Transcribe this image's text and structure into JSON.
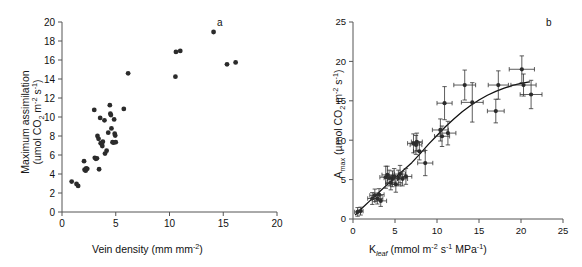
{
  "figure": {
    "width": 582,
    "height": 267,
    "background": "#ffffff",
    "marker_color": "#2b2b2b",
    "axis_color": "#555555",
    "curve_color": "#111111"
  },
  "panels": [
    {
      "letter": "a",
      "name": "panel-a"
    },
    {
      "letter": "b",
      "name": "panel-b"
    }
  ],
  "chart_data": [
    {
      "type": "scatter",
      "panel": "a",
      "title": "",
      "xlabel": "Vein density (mm mm",
      "xlabel_sup": "-2",
      "xlabel_tail": ")",
      "ylabel_line1": "Maximum assimilation",
      "ylabel_line2_pre": "(umol CO",
      "ylabel_line2_sub": "2",
      "ylabel_line2_mid": " m",
      "ylabel_line2_sup1": "-2",
      "ylabel_line2_mid2": " s",
      "ylabel_line2_sup2": "-1",
      "ylabel_line2_tail": ")",
      "xlim": [
        0,
        20
      ],
      "ylim": [
        0,
        20
      ],
      "xticks": [
        0,
        5,
        10,
        15,
        20
      ],
      "yticks": [
        0,
        2,
        4,
        6,
        8,
        10,
        12,
        14,
        16,
        18,
        20
      ],
      "grid": false,
      "legend": "none",
      "error_bars": false,
      "points": [
        [
          0.9,
          3.2
        ],
        [
          1.35,
          2.95
        ],
        [
          1.5,
          2.75
        ],
        [
          2.05,
          5.35
        ],
        [
          2.1,
          4.45
        ],
        [
          2.2,
          4.35
        ],
        [
          2.25,
          4.6
        ],
        [
          2.35,
          4.55
        ],
        [
          3.0,
          10.75
        ],
        [
          3.05,
          5.7
        ],
        [
          3.15,
          5.6
        ],
        [
          3.25,
          5.65
        ],
        [
          3.3,
          8.0
        ],
        [
          3.4,
          7.7
        ],
        [
          3.45,
          4.5
        ],
        [
          3.55,
          9.9
        ],
        [
          3.6,
          7.25
        ],
        [
          3.7,
          7.15
        ],
        [
          3.75,
          6.95
        ],
        [
          3.8,
          7.4
        ],
        [
          3.95,
          9.65
        ],
        [
          4.0,
          6.15
        ],
        [
          4.15,
          6.45
        ],
        [
          4.3,
          8.35
        ],
        [
          4.45,
          11.25
        ],
        [
          4.5,
          10.35
        ],
        [
          4.55,
          10.2
        ],
        [
          4.6,
          8.8
        ],
        [
          4.7,
          7.35
        ],
        [
          4.8,
          7.3
        ],
        [
          4.85,
          9.75
        ],
        [
          4.9,
          8.25
        ],
        [
          4.95,
          8.05
        ],
        [
          5.0,
          7.35
        ],
        [
          5.75,
          10.85
        ],
        [
          6.15,
          14.6
        ],
        [
          10.55,
          14.25
        ],
        [
          10.6,
          16.85
        ],
        [
          11.0,
          16.95
        ],
        [
          14.1,
          18.95
        ],
        [
          15.35,
          15.55
        ],
        [
          16.15,
          15.75
        ]
      ]
    },
    {
      "type": "scatter",
      "panel": "b",
      "title": "",
      "xlabel_pre": "K",
      "xlabel_sub": "leaf",
      "xlabel_mid": " (mmol m",
      "xlabel_sup1": "-2",
      "xlabel_mid2": " s",
      "xlabel_sup2": "-1",
      "xlabel_mid3": " MPa",
      "xlabel_sup3": "-1",
      "xlabel_tail": ")",
      "ylabel_pre": "A",
      "ylabel_sub": "max",
      "ylabel_mid": " (µmol CO",
      "ylabel_sub2": "2",
      "ylabel_mid2": " m",
      "ylabel_sup1": "-2",
      "ylabel_mid3": " s",
      "ylabel_sup2": "-1",
      "ylabel_tail": ")",
      "xlim": [
        0,
        25
      ],
      "ylim": [
        0,
        25
      ],
      "xticks": [
        0,
        5,
        10,
        15,
        20,
        25
      ],
      "yticks": [
        0,
        5,
        10,
        15,
        20,
        25
      ],
      "grid": false,
      "legend": "none",
      "error_bars": true,
      "fit_curve": {
        "label": "saturating fit",
        "x": [
          0.3,
          1,
          2,
          3,
          4,
          5,
          6,
          7,
          8,
          9,
          10,
          11,
          12,
          13,
          14,
          15,
          16,
          17,
          18,
          19,
          20,
          21
        ],
        "y": [
          0.55,
          1.3,
          2.3,
          3.3,
          4.3,
          5.25,
          6.2,
          7.15,
          8.3,
          9.5,
          10.6,
          11.7,
          12.7,
          13.6,
          14.4,
          15.1,
          15.7,
          16.2,
          16.6,
          16.95,
          17.2,
          17.4
        ]
      },
      "points": [
        {
          "x": 0.55,
          "y": 0.9,
          "xerr": 0.35,
          "yerr": 0.55
        },
        {
          "x": 0.9,
          "y": 1.0,
          "xerr": 0.3,
          "yerr": 0.5
        },
        {
          "x": 2.3,
          "y": 2.6,
          "xerr": 0.55,
          "yerr": 0.75
        },
        {
          "x": 2.6,
          "y": 3.0,
          "xerr": 0.6,
          "yerr": 0.8
        },
        {
          "x": 2.9,
          "y": 2.6,
          "xerr": 0.65,
          "yerr": 0.7
        },
        {
          "x": 3.1,
          "y": 3.1,
          "xerr": 0.6,
          "yerr": 0.75
        },
        {
          "x": 3.3,
          "y": 2.3,
          "xerr": 0.7,
          "yerr": 0.7
        },
        {
          "x": 3.9,
          "y": 5.3,
          "xerr": 0.7,
          "yerr": 1.4
        },
        {
          "x": 4.1,
          "y": 5.6,
          "xerr": 0.65,
          "yerr": 1.1
        },
        {
          "x": 4.3,
          "y": 5.2,
          "xerr": 0.6,
          "yerr": 1.0
        },
        {
          "x": 4.5,
          "y": 4.6,
          "xerr": 0.6,
          "yerr": 0.9
        },
        {
          "x": 4.7,
          "y": 5.1,
          "xerr": 0.6,
          "yerr": 1.0
        },
        {
          "x": 4.9,
          "y": 5.4,
          "xerr": 0.6,
          "yerr": 1.0
        },
        {
          "x": 5.1,
          "y": 4.4,
          "xerr": 0.6,
          "yerr": 1.0
        },
        {
          "x": 5.4,
          "y": 5.2,
          "xerr": 0.6,
          "yerr": 1.0
        },
        {
          "x": 5.6,
          "y": 5.7,
          "xerr": 0.65,
          "yerr": 1.1
        },
        {
          "x": 5.9,
          "y": 5.1,
          "xerr": 0.6,
          "yerr": 0.9
        },
        {
          "x": 6.3,
          "y": 5.4,
          "xerr": 0.7,
          "yerr": 1.0
        },
        {
          "x": 7.2,
          "y": 9.6,
          "xerr": 0.7,
          "yerr": 1.2
        },
        {
          "x": 7.5,
          "y": 9.4,
          "xerr": 0.7,
          "yerr": 1.2
        },
        {
          "x": 7.6,
          "y": 9.8,
          "xerr": 0.65,
          "yerr": 1.1
        },
        {
          "x": 7.9,
          "y": 8.6,
          "xerr": 0.7,
          "yerr": 1.1
        },
        {
          "x": 8.6,
          "y": 7.1,
          "xerr": 0.9,
          "yerr": 1.6
        },
        {
          "x": 10.4,
          "y": 11.3,
          "xerr": 0.95,
          "yerr": 1.4
        },
        {
          "x": 10.6,
          "y": 10.5,
          "xerr": 0.9,
          "yerr": 1.3
        },
        {
          "x": 10.9,
          "y": 14.7,
          "xerr": 0.9,
          "yerr": 2.1
        },
        {
          "x": 11.3,
          "y": 10.9,
          "xerr": 0.95,
          "yerr": 1.5
        },
        {
          "x": 13.3,
          "y": 17.0,
          "xerr": 1.3,
          "yerr": 1.9
        },
        {
          "x": 14.2,
          "y": 14.8,
          "xerr": 1.3,
          "yerr": 2.5
        },
        {
          "x": 17.0,
          "y": 13.7,
          "xerr": 1.0,
          "yerr": 1.5
        },
        {
          "x": 17.3,
          "y": 17.0,
          "xerr": 1.2,
          "yerr": 1.8
        },
        {
          "x": 20.1,
          "y": 19.0,
          "xerr": 1.5,
          "yerr": 1.7
        },
        {
          "x": 20.3,
          "y": 17.0,
          "xerr": 1.5,
          "yerr": 1.4
        },
        {
          "x": 21.2,
          "y": 15.8,
          "xerr": 1.3,
          "yerr": 1.8
        }
      ]
    }
  ]
}
